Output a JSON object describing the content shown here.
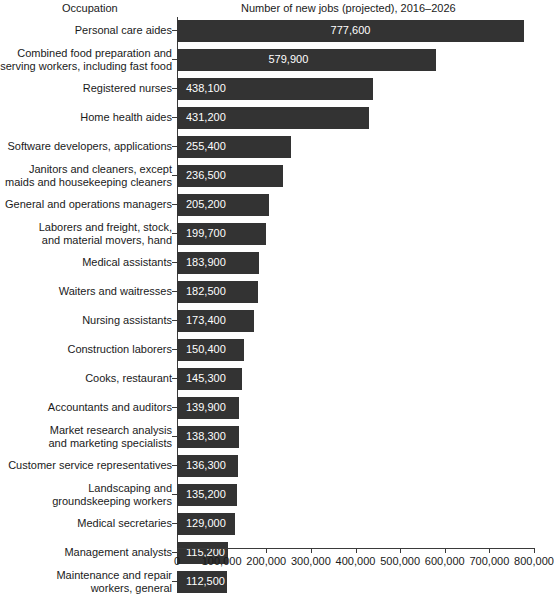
{
  "header": {
    "occupation_label": "Occupation",
    "value_label": "Number of new jobs (projected), 2016–2026"
  },
  "colors": {
    "bar": "#333333",
    "axis": "#3a3a3a",
    "background": "#ffffff",
    "bar_label_text": "#ffffff",
    "text": "#1a1a1a"
  },
  "chart_data": {
    "type": "bar",
    "orientation": "horizontal",
    "title": "",
    "xlabel": "Number of new jobs (projected), 2016–2026",
    "ylabel": "Occupation",
    "xlim": [
      0,
      800000
    ],
    "grid": false,
    "legend": null,
    "xticks": [
      0,
      100000,
      200000,
      300000,
      400000,
      500000,
      600000,
      700000,
      800000
    ],
    "xticklabels": [
      "0",
      "100,000",
      "200,000",
      "300,000",
      "400,000",
      "500,000",
      "600,000",
      "700,000",
      "800,000"
    ],
    "categories": [
      "Personal care aides",
      "Combined food preparation and\nserving workers, including fast food",
      "Registered nurses",
      "Home health aides",
      "Software developers, applications",
      "Janitors and cleaners, except\nmaids and housekeeping cleaners",
      "General and operations managers",
      "Laborers and freight, stock,\nand material movers, hand",
      "Medical assistants",
      "Waiters and waitresses",
      "Nursing assistants",
      "Construction laborers",
      "Cooks, restaurant",
      "Accountants and auditors",
      "Market research analysis\nand marketing specialists",
      "Customer service representatives",
      "Landscaping and\ngroundskeeping workers",
      "Medical secretaries",
      "Management analysts",
      "Maintenance and repair\nworkers, general"
    ],
    "values": [
      777600,
      579900,
      438100,
      431200,
      255400,
      236500,
      205200,
      199700,
      183900,
      182500,
      173400,
      150400,
      145300,
      139900,
      138300,
      136300,
      135200,
      129000,
      115200,
      112500
    ],
    "value_labels": [
      "777,600",
      "579,900",
      "438,100",
      "431,200",
      "255,400",
      "236,500",
      "205,200",
      "199,700",
      "183,900",
      "182,500",
      "173,400",
      "150,400",
      "145,300",
      "139,900",
      "138,300",
      "136,300",
      "135,200",
      "129,000",
      "115,200",
      "112,500"
    ]
  }
}
